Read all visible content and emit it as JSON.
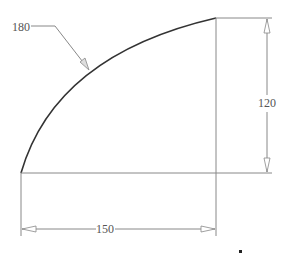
{
  "drawing": {
    "type": "technical-dimension-drawing",
    "shape": "quarter-circle-arc sector outline",
    "dimensions": {
      "arc_length_label": "180",
      "height_label": "120",
      "width_label": "150"
    },
    "colors": {
      "arc": "#333333",
      "lines": "#888888",
      "text": "#555555",
      "background": "#ffffff"
    }
  }
}
